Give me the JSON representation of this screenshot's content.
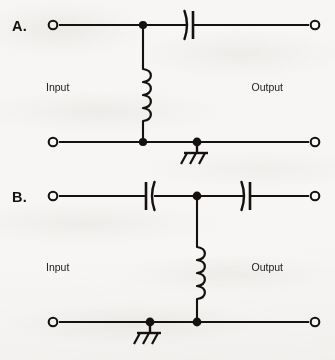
{
  "figure": {
    "background_color": "#f7f6f4",
    "ink_color": "#14110f"
  },
  "circuits": [
    {
      "id": "A",
      "label": "A.",
      "input_label": "Input",
      "output_label": "Output",
      "description": "High-pass filter: series capacitor on top rail, shunt inductor, chassis ground on bottom rail",
      "topology": "series-capacitor-shunt-inductor",
      "components": [
        {
          "type": "capacitor",
          "name": "series-capacitor",
          "rail": "top",
          "orientation": "curved-right-plate-on-right",
          "x": 190,
          "y": 25
        },
        {
          "type": "inductor",
          "name": "shunt-inductor",
          "turns": 4,
          "x": 143,
          "y_top": 25,
          "y_bottom": 142
        },
        {
          "type": "ground",
          "name": "chassis-ground",
          "rail": "bottom",
          "x": 197,
          "y": 142
        }
      ],
      "terminals": [
        {
          "name": "input-top-terminal",
          "x": 53,
          "y": 25
        },
        {
          "name": "input-bottom-terminal",
          "x": 53,
          "y": 142
        },
        {
          "name": "output-top-terminal",
          "x": 315,
          "y": 25
        },
        {
          "name": "output-bottom-terminal",
          "x": 315,
          "y": 142
        }
      ],
      "junctions": [
        {
          "name": "top-junction",
          "x": 143,
          "y": 25
        },
        {
          "name": "bottom-inductor-junction",
          "x": 143,
          "y": 142
        },
        {
          "name": "bottom-ground-junction",
          "x": 197,
          "y": 142
        }
      ]
    },
    {
      "id": "B",
      "label": "B.",
      "input_label": "Input",
      "output_label": "Output",
      "description": "Band-pass / T-section filter: two series capacitors on top rail, shunt inductor, chassis ground on bottom rail",
      "topology": "two-series-capacitors-shunt-inductor",
      "components": [
        {
          "type": "capacitor",
          "name": "series-capacitor-input",
          "rail": "top",
          "orientation": "curved-plate-on-right",
          "x": 150,
          "y": 196
        },
        {
          "type": "capacitor",
          "name": "series-capacitor-output",
          "rail": "top",
          "orientation": "curved-plate-on-left",
          "x": 247,
          "y": 196
        },
        {
          "type": "inductor",
          "name": "shunt-inductor",
          "turns": 4,
          "x": 197,
          "y_top": 196,
          "y_bottom": 322
        },
        {
          "type": "ground",
          "name": "chassis-ground",
          "rail": "bottom",
          "x": 150,
          "y": 322
        }
      ],
      "terminals": [
        {
          "name": "input-top-terminal",
          "x": 53,
          "y": 196
        },
        {
          "name": "input-bottom-terminal",
          "x": 53,
          "y": 322
        },
        {
          "name": "output-top-terminal",
          "x": 315,
          "y": 196
        },
        {
          "name": "output-bottom-terminal",
          "x": 315,
          "y": 322
        }
      ],
      "junctions": [
        {
          "name": "top-junction",
          "x": 197,
          "y": 196
        },
        {
          "name": "bottom-inductor-junction",
          "x": 197,
          "y": 322
        },
        {
          "name": "bottom-ground-junction",
          "x": 150,
          "y": 322
        }
      ]
    }
  ]
}
